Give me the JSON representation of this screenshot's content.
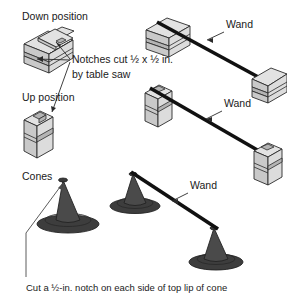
{
  "diagram": {
    "labels": {
      "down_position": "Down position",
      "up_position": "Up position",
      "notches_line1": "Notches cut ½ x ½ in.",
      "notches_line2": "by table saw",
      "cones": "Cones",
      "wand_top": "Wand",
      "wand_middle": "Wand",
      "wand_bottom": "Wand",
      "caption": "Cut a ½-in. notch on each side of top lip of cone"
    },
    "colors": {
      "background": "#ffffff",
      "block_top": "#e2e2e2",
      "block_side": "#c9c9c9",
      "block_front": "#dcdcdc",
      "cone": "#4a4a4a",
      "wand": "#111111",
      "text": "#1a1a1a",
      "outline": "#2b2b2b"
    },
    "rows": [
      {
        "name": "down-position-row",
        "description": "Two horizontal notched blocks connected by a wand, wand resting in the low notch"
      },
      {
        "name": "up-position-row",
        "description": "Two vertical notched blocks connected by a wand, wand resting in the high notch"
      },
      {
        "name": "cones-row",
        "description": "Three traffic cones, a wand resting in notches on the top lip of two of them"
      }
    ]
  }
}
